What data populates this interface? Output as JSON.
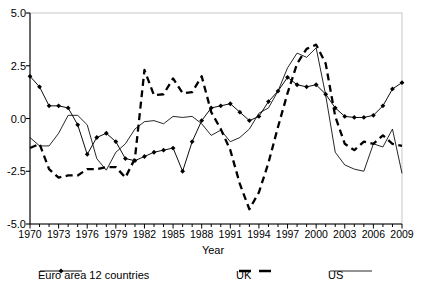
{
  "chart_data": {
    "type": "line",
    "title": "",
    "xlabel": "Year",
    "ylabel": "",
    "xlim": [
      1970,
      2009
    ],
    "ylim": [
      -5.0,
      5.0
    ],
    "grid": false,
    "legend_position": "bottom",
    "ytick_labels": [
      "5.0",
      "2.5",
      "0.0",
      "-2.5",
      "-5.0"
    ],
    "ytick_values": [
      5.0,
      2.5,
      0.0,
      -2.5,
      -5.0
    ],
    "xtick_labels": [
      "1970",
      "1973",
      "1976",
      "1979",
      "1982",
      "1985",
      "1988",
      "1991",
      "1994",
      "1997",
      "2000",
      "2003",
      "2006",
      "2009"
    ],
    "xtick_values": [
      1970,
      1973,
      1976,
      1979,
      1982,
      1985,
      1988,
      1991,
      1994,
      1997,
      2000,
      2003,
      2006,
      2009
    ],
    "x": [
      1970,
      1971,
      1972,
      1973,
      1974,
      1975,
      1976,
      1977,
      1978,
      1979,
      1980,
      1981,
      1982,
      1983,
      1984,
      1985,
      1986,
      1987,
      1988,
      1989,
      1990,
      1991,
      1992,
      1993,
      1994,
      1995,
      1996,
      1997,
      1998,
      1999,
      2000,
      2001,
      2002,
      2003,
      2004,
      2005,
      2006,
      2007,
      2008,
      2009
    ],
    "series": [
      {
        "name": "Euro area 12 countries",
        "style": "solid-markers",
        "color": "#000000",
        "values": [
          2.0,
          1.5,
          0.6,
          0.6,
          0.5,
          -0.3,
          -1.7,
          -0.9,
          -0.7,
          -1.1,
          -1.9,
          -2.0,
          -1.8,
          -1.6,
          -1.5,
          -1.4,
          -2.5,
          -1.1,
          -0.1,
          0.5,
          0.6,
          0.7,
          0.3,
          -0.1,
          0.1,
          0.8,
          1.3,
          1.95,
          1.6,
          1.5,
          1.6,
          1.15,
          0.5,
          0.1,
          0.05,
          0.05,
          0.15,
          0.6,
          1.4,
          1.7
        ]
      },
      {
        "name": "UK",
        "style": "dashed",
        "color": "#000000",
        "values": [
          -1.4,
          -1.2,
          -2.4,
          -2.8,
          -2.7,
          -2.7,
          -2.4,
          -2.4,
          -2.3,
          -2.3,
          -2.8,
          -1.9,
          2.3,
          1.1,
          1.15,
          1.9,
          1.2,
          1.25,
          2.0,
          0.3,
          -0.5,
          -1.5,
          -3.1,
          -4.3,
          -3.5,
          -2.1,
          -0.4,
          1.2,
          2.6,
          3.3,
          3.5,
          2.6,
          0.1,
          -1.2,
          -1.5,
          -1.1,
          -1.2,
          -0.8,
          -1.2,
          -1.3
        ]
      },
      {
        "name": "US",
        "style": "thin-solid",
        "color": "#000000",
        "values": [
          -0.9,
          -1.3,
          -1.3,
          -0.7,
          0.15,
          0.15,
          -0.3,
          -1.9,
          -2.45,
          -1.6,
          -1.2,
          -0.5,
          -0.15,
          -0.1,
          -0.25,
          0.1,
          0.05,
          0.1,
          -0.25,
          -0.8,
          -0.55,
          -1.1,
          -0.9,
          -0.5,
          0.25,
          0.5,
          1.3,
          2.4,
          3.1,
          2.9,
          3.35,
          1.1,
          -1.6,
          -2.2,
          -2.4,
          -2.5,
          -1.2,
          -1.35,
          -0.5,
          -2.6
        ]
      }
    ]
  },
  "legend": {
    "items": [
      {
        "label": "Euro area 12 countries",
        "style": "solid-markers"
      },
      {
        "label": "UK",
        "style": "dashed"
      },
      {
        "label": "US",
        "style": "thin-solid"
      }
    ]
  },
  "axis_title": {
    "x": "Year"
  }
}
